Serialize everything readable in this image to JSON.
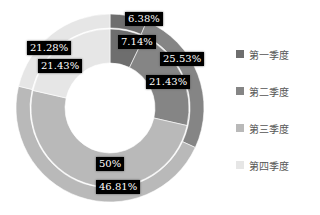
{
  "chart_data": {
    "type": "pie",
    "subtype": "nested-donut",
    "title": "",
    "categories": [
      "第一季度",
      "第二季度",
      "第三季度",
      "第四季度"
    ],
    "colors": [
      "#6e6e6e",
      "#858585",
      "#b9b9b9",
      "#e6e6e6"
    ],
    "series": [
      {
        "name": "outer",
        "values": [
          6.38,
          25.53,
          46.81,
          21.28
        ],
        "labels": [
          "6.38%",
          "25.53%",
          "46.81%",
          "21.28%"
        ]
      },
      {
        "name": "inner",
        "values": [
          7.14,
          21.43,
          50,
          21.43
        ],
        "labels": [
          "7.14%",
          "21.43%",
          "50%",
          "21.43%"
        ]
      }
    ],
    "legend_position": "right"
  },
  "legend": {
    "items": [
      {
        "label": "第一季度",
        "color": "#6e6e6e"
      },
      {
        "label": "第二季度",
        "color": "#858585"
      },
      {
        "label": "第三季度",
        "color": "#b9b9b9"
      },
      {
        "label": "第四季度",
        "color": "#e6e6e6"
      }
    ]
  }
}
